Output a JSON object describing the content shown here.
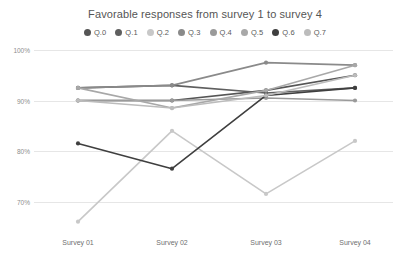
{
  "chart_data": {
    "type": "line",
    "title": "Favorable responses from survey 1 to survey 4",
    "xlabel": "",
    "ylabel": "",
    "categories": [
      "Survey 01",
      "Survey 02",
      "Survey 03",
      "Survey 04"
    ],
    "ytick_labels": [
      "100%",
      "90%",
      "80%",
      "70%"
    ],
    "ytick_values": [
      100,
      90,
      80,
      70
    ],
    "ylim": [
      65,
      100
    ],
    "grid": true,
    "legend_position": "top-center",
    "series": [
      {
        "name": "Q.0",
        "color": "#555555",
        "values": [
          90.0,
          90.0,
          92.0,
          95.0
        ]
      },
      {
        "name": "Q.1",
        "color": "#5f5f5f",
        "values": [
          92.5,
          93.0,
          91.5,
          92.5
        ]
      },
      {
        "name": "Q.2",
        "color": "#c8c8c8",
        "values": [
          66.0,
          84.0,
          71.5,
          82.0
        ]
      },
      {
        "name": "Q.3",
        "color": "#8a8a8a",
        "values": [
          92.5,
          93.0,
          97.5,
          97.0
        ]
      },
      {
        "name": "Q.4",
        "color": "#9a9a9a",
        "values": [
          90.0,
          90.0,
          90.5,
          90.0
        ]
      },
      {
        "name": "Q.5",
        "color": "#a8a8a8",
        "values": [
          92.5,
          88.5,
          92.0,
          97.0
        ]
      },
      {
        "name": "Q.6",
        "color": "#3f3f3f",
        "values": [
          81.5,
          76.5,
          91.0,
          92.5
        ]
      },
      {
        "name": "Q.7",
        "color": "#bcbcbc",
        "values": [
          90.0,
          88.5,
          91.0,
          95.0
        ]
      }
    ]
  },
  "axis": {
    "grid_color": "#e6e6e6",
    "ytick_color": "#8d8d8d",
    "xtick_color": "#6f6f6f"
  }
}
